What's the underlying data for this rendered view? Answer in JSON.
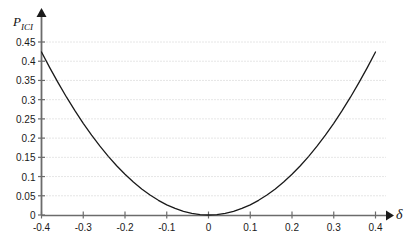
{
  "chart_data": {
    "type": "line",
    "title": "",
    "subtitle": "",
    "ylabel": "P",
    "ylabel_sub": "ICI",
    "xlabel": "δ",
    "xlim": [
      -0.4,
      0.4
    ],
    "ylim": [
      0,
      0.45
    ],
    "grid": true,
    "grid_axis": "y",
    "legend": null,
    "xticks": [
      "-0.4",
      "-0.3",
      "-0.2",
      "-0.1",
      "0",
      "0.1",
      "0.2",
      "0.3",
      "0.4"
    ],
    "xtick_values": [
      -0.4,
      -0.3,
      -0.2,
      -0.1,
      0,
      0.1,
      0.2,
      0.3,
      0.4
    ],
    "yticks": [
      "0",
      "0.05",
      "0.1",
      "0.15",
      "0.2",
      "0.25",
      "0.3",
      "0.35",
      "0.4",
      "0.45"
    ],
    "ytick_values": [
      0,
      0.05,
      0.1,
      0.15,
      0.2,
      0.25,
      0.3,
      0.35,
      0.4,
      0.45
    ],
    "series": [
      {
        "name": "P_ICI",
        "color": "#1a1a1a",
        "linewidth": 1.3,
        "x": [
          -0.4,
          -0.38,
          -0.36,
          -0.34,
          -0.32,
          -0.3,
          -0.28,
          -0.26,
          -0.24,
          -0.22,
          -0.2,
          -0.18,
          -0.16,
          -0.14,
          -0.12,
          -0.1,
          -0.08,
          -0.06,
          -0.04,
          -0.02,
          0.0,
          0.02,
          0.04,
          0.06,
          0.08,
          0.1,
          0.12,
          0.14,
          0.16,
          0.18,
          0.2,
          0.22,
          0.24,
          0.26,
          0.28,
          0.3,
          0.32,
          0.34,
          0.36,
          0.38,
          0.4
        ],
        "y": [
          0.424,
          0.3828,
          0.3437,
          0.3064,
          0.2714,
          0.2385,
          0.2077,
          0.1791,
          0.1526,
          0.1282,
          0.106,
          0.0859,
          0.0678,
          0.0519,
          0.0382,
          0.0265,
          0.017,
          0.0095,
          0.0042,
          0.0011,
          0.0,
          0.0011,
          0.0042,
          0.0095,
          0.017,
          0.0265,
          0.0382,
          0.0519,
          0.0678,
          0.0859,
          0.106,
          0.1282,
          0.1526,
          0.1791,
          0.2077,
          0.2385,
          0.2714,
          0.3064,
          0.3437,
          0.3828,
          0.424
        ]
      }
    ],
    "colors": {
      "curve": "#1a1a1a",
      "axis": "#6b6b6b",
      "grid": "#bfbfbf",
      "text": "#1a1a1a",
      "background": "#ffffff"
    },
    "annotations": []
  }
}
